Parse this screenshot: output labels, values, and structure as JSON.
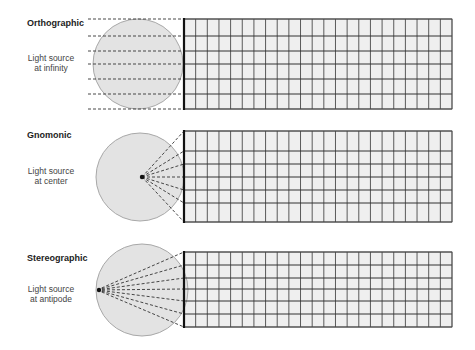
{
  "panels": [
    {
      "title": "Orthographic",
      "desc_line1": "Light source",
      "desc_line2": "at infinity",
      "type": "orthographic",
      "title_y": 18,
      "desc_y": 53,
      "circle": {
        "cx": 138,
        "cy": 64,
        "r": 45
      },
      "source": {
        "x": 88,
        "y": 64
      },
      "grid": {
        "x0": 184,
        "x1": 452,
        "rows": [
          19,
          36,
          51,
          64,
          79,
          94,
          109
        ],
        "cols": 23
      }
    },
    {
      "title": "Gnomonic",
      "desc_line1": "Light source",
      "desc_line2": "at center",
      "type": "gnomonic",
      "title_y": 130,
      "desc_y": 166,
      "circle": {
        "cx": 140,
        "cy": 177,
        "r": 44
      },
      "source": {
        "x": 142,
        "y": 177
      },
      "grid": {
        "x0": 184,
        "x1": 452,
        "rows": [
          131,
          151,
          164,
          177,
          190,
          203,
          222
        ],
        "cols": 23
      }
    },
    {
      "title": "Stereographic",
      "desc_line1": "Light source",
      "desc_line2": "at antipode",
      "type": "stereographic",
      "title_y": 253,
      "desc_y": 284,
      "circle": {
        "cx": 142,
        "cy": 290,
        "r": 46
      },
      "source": {
        "x": 97,
        "y": 290
      },
      "grid": {
        "x0": 184,
        "x1": 452,
        "rows": [
          252,
          265,
          278,
          289,
          301,
          314,
          327
        ],
        "cols": 23
      }
    }
  ],
  "colors": {
    "circle_fill": "#e3e3e3",
    "circle_stroke": "#a8a8a8",
    "grid_fill": "#efefef",
    "grid_line": "#333333",
    "dash_line": "#333333"
  }
}
